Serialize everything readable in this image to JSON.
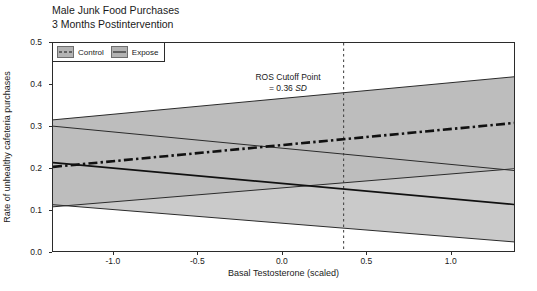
{
  "chart_data": {
    "type": "line",
    "title": "Male Junk Food Purchases",
    "subtitle": "3 Months Postintervention",
    "xlabel": "Basal Testosterone (scaled)",
    "ylabel": "Rate of unhealthy cafeteria purchases",
    "xlim": [
      -1.36,
      1.38
    ],
    "ylim": [
      0.0,
      0.5
    ],
    "xticks": [
      -1.0,
      -0.5,
      0.0,
      0.5,
      1.0
    ],
    "xtick_labels": [
      "-1.0",
      "-0.5",
      "0.0",
      "0.5",
      "1.0"
    ],
    "yticks": [
      0.0,
      0.1,
      0.2,
      0.3,
      0.4,
      0.5
    ],
    "ytick_labels": [
      "0.0",
      "0.1",
      "0.2",
      "0.3",
      "0.4",
      "0.5"
    ],
    "grid": false,
    "legend_position": "top-left",
    "band_fill": "#b9b9b9",
    "band_fill_overlap": "#a2a2a2",
    "line_color": "#111111",
    "series": [
      {
        "name": "Control",
        "style": "dash-dot",
        "x": [
          -1.36,
          1.38
        ],
        "values": [
          0.205,
          0.31
        ],
        "ci_upper": [
          0.317,
          0.42
        ],
        "ci_lower": [
          0.11,
          0.201
        ]
      },
      {
        "name": "Expose",
        "style": "solid",
        "x": [
          -1.36,
          1.38
        ],
        "values": [
          0.215,
          0.115
        ],
        "ci_upper": [
          0.302,
          0.196
        ],
        "ci_lower": [
          0.115,
          0.026
        ]
      }
    ],
    "annotations": [
      {
        "name": "ros-cutoff",
        "line1": "ROS Cutoff Point",
        "line2_prefix": "= 0.36 ",
        "line2_italic": "SD",
        "x_value": 0.36,
        "vline_style": "dashed"
      }
    ]
  },
  "legend": {
    "entries": [
      {
        "label": "Control",
        "key": "dash-dot-key-icon"
      },
      {
        "label": "Expose",
        "key": "solid-line-key-icon"
      }
    ]
  }
}
